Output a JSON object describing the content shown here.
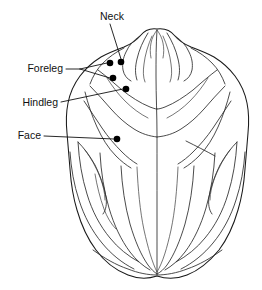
{
  "figure": {
    "width": 262,
    "height": 290,
    "background_color": "#ffffff",
    "line_color": "#1a1a1a",
    "dot_color": "#000000",
    "text_color": "#111111"
  },
  "labels": {
    "neck": "Neck",
    "foreleg": "Foreleg",
    "hindleg": "Hindleg",
    "face": "Face"
  },
  "annotations": [
    {
      "id": "neck",
      "label": "Neck",
      "text_x": 112,
      "text_y": 17,
      "anchor": "middle",
      "dot_x": 121,
      "dot_y": 62,
      "dot_r": 3.2
    },
    {
      "id": "foreleg-upper",
      "label": "Foreleg",
      "text_x": 63,
      "text_y": 69,
      "anchor": "end",
      "dot_x": 110,
      "dot_y": 63,
      "dot_r": 3.2
    },
    {
      "id": "foreleg-lower",
      "label": "Foreleg",
      "text_x": 63,
      "text_y": 69,
      "anchor": "end",
      "dot_x": 113,
      "dot_y": 78,
      "dot_r": 3.2
    },
    {
      "id": "hindleg",
      "label": "Hindleg",
      "text_x": 58,
      "text_y": 103,
      "anchor": "end",
      "dot_x": 126,
      "dot_y": 89,
      "dot_r": 3.2
    },
    {
      "id": "face",
      "label": "Face",
      "text_x": 40,
      "text_y": 136,
      "anchor": "end",
      "dot_x": 117,
      "dot_y": 139,
      "dot_r": 3.2
    }
  ]
}
